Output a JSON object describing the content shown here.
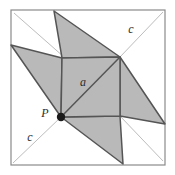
{
  "figure": {
    "background_color": "#ffffff",
    "frame": {
      "name": "outer-square-frame",
      "stroke_color": "#8a8a8a",
      "stroke_width": 1.2,
      "x": 11,
      "y": 10,
      "width": 154,
      "height": 155
    },
    "shaded_fill_color": "#b9b9b9",
    "shaded_stroke_color": "#555555",
    "thin_line_color": "#bdbdbd",
    "point_color": "#1a1a1a",
    "labels": {
      "center_square": "a",
      "hypotenuse_upper_right": "c",
      "hypotenuse_lower_left": "c",
      "vertex_point": "P"
    },
    "label_positions": {
      "center_square": {
        "x": 83,
        "y": 86
      },
      "hypotenuse_upper_right": {
        "x": 131,
        "y": 33
      },
      "hypotenuse_lower_left": {
        "x": 30,
        "y": 141
      },
      "vertex_point": {
        "x": 45,
        "y": 117
      }
    },
    "center_square": {
      "name": "central-square-a",
      "vertices": [
        {
          "x": 62,
          "y": 58
        },
        {
          "x": 120,
          "y": 57
        },
        {
          "x": 120,
          "y": 116
        },
        {
          "x": 61,
          "y": 117
        }
      ],
      "diagonal": {
        "x1": 61,
        "y1": 117,
        "x2": 120,
        "y2": 57
      }
    },
    "blades": [
      {
        "name": "blade-top",
        "points": [
          {
            "x": 62,
            "y": 58
          },
          {
            "x": 54,
            "y": 11
          },
          {
            "x": 120,
            "y": 57
          }
        ]
      },
      {
        "name": "blade-left",
        "points": [
          {
            "x": 61,
            "y": 117
          },
          {
            "x": 11,
            "y": 45
          },
          {
            "x": 62,
            "y": 58
          }
        ]
      },
      {
        "name": "blade-right",
        "points": [
          {
            "x": 120,
            "y": 57
          },
          {
            "x": 165,
            "y": 124
          },
          {
            "x": 120,
            "y": 116
          }
        ]
      },
      {
        "name": "blade-bottom",
        "points": [
          {
            "x": 120,
            "y": 116
          },
          {
            "x": 123,
            "y": 164
          },
          {
            "x": 61,
            "y": 117
          }
        ]
      }
    ],
    "thin_lines": [
      {
        "name": "thin-diagonal-upper-left",
        "x1": 14,
        "y1": 13,
        "x2": 64,
        "y2": 57
      },
      {
        "name": "thin-diagonal-upper-right",
        "x1": 120,
        "y1": 57,
        "x2": 163,
        "y2": 12
      },
      {
        "name": "thin-diagonal-lower-left",
        "x1": 61,
        "y1": 117,
        "x2": 13,
        "y2": 163
      },
      {
        "name": "thin-diagonal-lower-right",
        "x1": 120,
        "y1": 116,
        "x2": 163,
        "y2": 161
      }
    ],
    "vertex_marker": {
      "name": "point-p-marker",
      "x": 61,
      "y": 117,
      "radius": 4.2
    }
  }
}
